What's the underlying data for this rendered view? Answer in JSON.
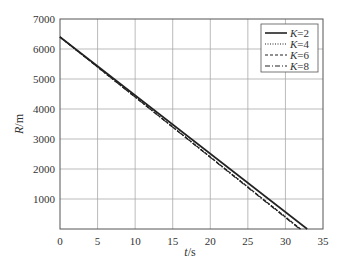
{
  "chart_data": {
    "type": "line",
    "title": "",
    "xlabel": "t/s",
    "xlabel_var": "t",
    "xlabel_unit": "/s",
    "ylabel": "R/m",
    "ylabel_var": "R",
    "ylabel_unit": "/m",
    "xlim": [
      0,
      35
    ],
    "ylim": [
      0,
      7000
    ],
    "xticks": [
      0,
      5,
      10,
      15,
      20,
      25,
      30,
      35
    ],
    "yticks": [
      1000,
      2000,
      3000,
      4000,
      5000,
      6000,
      7000
    ],
    "grid": true,
    "legend_position": "upper right",
    "series": [
      {
        "name": "K=2",
        "var": "K",
        "val": "=2",
        "style": "solid",
        "x": [
          0,
          32.9
        ],
        "y": [
          6400,
          0
        ]
      },
      {
        "name": "K=4",
        "var": "K",
        "val": "=4",
        "style": "dotted",
        "x": [
          0,
          32.0
        ],
        "y": [
          6400,
          0
        ]
      },
      {
        "name": "K=6",
        "var": "K",
        "val": "=6",
        "style": "dashed",
        "x": [
          0,
          32.0
        ],
        "y": [
          6400,
          0
        ]
      },
      {
        "name": "K=8",
        "var": "K",
        "val": "=8",
        "style": "dashdot",
        "x": [
          0,
          31.9
        ],
        "y": [
          6400,
          0
        ]
      }
    ]
  }
}
